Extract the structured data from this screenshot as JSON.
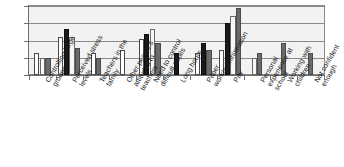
{
  "chart_data": {
    "type": "bar",
    "title": "",
    "subtitle": "",
    "xlabel": "",
    "ylabel": "",
    "ylim": [
      0,
      20
    ],
    "ytick_labels": [
      "0",
      "5",
      "10",
      "15",
      "20"
    ],
    "ytick_values": [
      0,
      5,
      10,
      15,
      20
    ],
    "grid": true,
    "legend": "none",
    "orientation": "vertical",
    "grouped": true,
    "categories": [
      "Controlling large groups",
      "Perceived stress levels",
      "Teachers in the family",
      "Other people's attitudes to teachers",
      "Need to control difficult pupils",
      "Long hours",
      "Paper work/administration",
      "Pay",
      "Personal experience at school",
      "Working with children",
      "Not confident enough"
    ],
    "category_lines": [
      [
        "Controlling large",
        "groups"
      ],
      [
        "Perceived stress",
        "levels"
      ],
      [
        "Teachers in the",
        "family"
      ],
      [
        "Other people's",
        "attitudes to",
        "teachers"
      ],
      [
        "Need to control",
        "difficult pupils"
      ],
      [
        "Long hours"
      ],
      [
        "Paper",
        "work/administration"
      ],
      [
        "Pay"
      ],
      [
        "Personal",
        "experience at",
        "school"
      ],
      [
        "Working with",
        "children"
      ],
      [
        "Not confident",
        "enough"
      ]
    ],
    "series": [
      {
        "name": "Series 1",
        "fill": "white",
        "color": "#ffffff",
        "values": [
          6.3,
          11.0,
          6.3,
          7.2,
          10.3,
          null,
          6.3,
          7.2,
          null,
          null,
          null
        ]
      },
      {
        "name": "Series 2",
        "fill": "black",
        "color": "#1a1a1a",
        "values": [
          null,
          13.2,
          null,
          null,
          11.8,
          6.3,
          9.2,
          15.0,
          null,
          null,
          null
        ]
      },
      {
        "name": "Series 3",
        "fill": "light",
        "color": "#f7f7f7",
        "values": [
          5.0,
          11.0,
          null,
          null,
          13.3,
          null,
          null,
          17.2,
          5.0,
          null,
          null
        ]
      },
      {
        "name": "Series 4",
        "fill": "dark-grey",
        "color": "#6b6b6b",
        "values": [
          5.0,
          7.9,
          5.0,
          null,
          9.3,
          null,
          7.2,
          19.3,
          6.3,
          9.3,
          6.3
        ]
      }
    ]
  }
}
